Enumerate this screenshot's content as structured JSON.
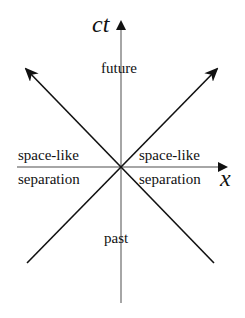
{
  "diagram": {
    "type": "spacetime-light-cone",
    "axes": {
      "vertical": {
        "label": "ct",
        "color": "#808080"
      },
      "horizontal": {
        "label": "x",
        "color": "#808080"
      }
    },
    "light_lines": {
      "color": "#111111"
    },
    "regions": {
      "future": "future",
      "past": "past",
      "left_line1": "space-like",
      "left_line2": "separation",
      "right_line1": "space-like",
      "right_line2": "separation"
    }
  }
}
